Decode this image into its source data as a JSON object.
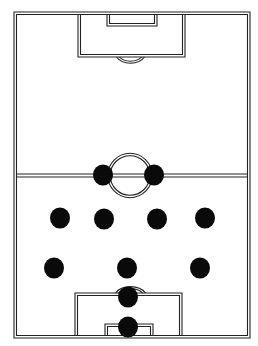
{
  "diagram": {
    "type": "football-formation",
    "formation": "4-4-2",
    "colors": {
      "background": "#ffffff",
      "lines": "#222222",
      "player": "#0a0a0a"
    },
    "pitch": {
      "outer": {
        "x": 14,
        "y": 12,
        "w": 236,
        "h": 326
      },
      "halfway_y": 175.5,
      "center_circle": {
        "cx": 130,
        "cy": 175.5,
        "r": 21
      },
      "top_penalty_box": {
        "x": 78,
        "y": 12,
        "w": 107,
        "h": 45
      },
      "top_goal_box": {
        "x": 107,
        "y": 12,
        "w": 50,
        "h": 14
      },
      "bottom_penalty_box": {
        "x": 75,
        "y": 293,
        "w": 107,
        "h": 45
      },
      "bottom_goal_box": {
        "x": 105,
        "y": 324,
        "w": 48,
        "h": 14
      }
    },
    "players": [
      {
        "role": "goalkeeper",
        "x": 128,
        "y": 327
      },
      {
        "role": "sweeper",
        "x": 128,
        "y": 297
      },
      {
        "role": "left-back",
        "x": 54,
        "y": 268
      },
      {
        "role": "centre-back",
        "x": 127,
        "y": 268
      },
      {
        "role": "right-back",
        "x": 200,
        "y": 268
      },
      {
        "role": "left-midfield",
        "x": 60,
        "y": 218
      },
      {
        "role": "centre-midfield-left",
        "x": 104,
        "y": 219
      },
      {
        "role": "centre-midfield-right",
        "x": 157,
        "y": 219
      },
      {
        "role": "right-midfield",
        "x": 205,
        "y": 218
      },
      {
        "role": "forward-left",
        "x": 103,
        "y": 175
      },
      {
        "role": "forward-right",
        "x": 154,
        "y": 175
      }
    ],
    "player_radius": 10
  }
}
